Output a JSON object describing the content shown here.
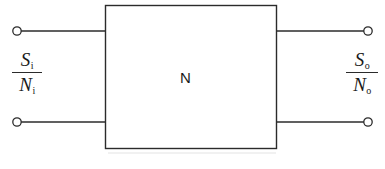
{
  "figure": {
    "type": "two-port-network-block-diagram",
    "background_color": "#ffffff",
    "line_color": "#2b2b2b",
    "text_color": "#1a1a1a",
    "block": {
      "label": "N",
      "x": 105,
      "y": 5,
      "width": 172,
      "height": 144,
      "fill": "#ffffff",
      "stroke": "#2b2b2b",
      "stroke_width": 1.4
    },
    "input_port": {
      "label_numerator": "S",
      "label_numerator_sub": "i",
      "label_denominator": "N",
      "label_denominator_sub": "i",
      "label_plain": "Si/Ni",
      "terminal_top": {
        "cx": 17,
        "cy": 31
      },
      "terminal_bottom": {
        "cx": 17,
        "cy": 122
      },
      "wire_top": {
        "x1": 22,
        "y1": 31,
        "x2": 105,
        "y2": 31
      },
      "wire_bottom": {
        "x1": 22,
        "y1": 122,
        "x2": 105,
        "y2": 122
      }
    },
    "output_port": {
      "label_numerator": "S",
      "label_numerator_sub": "o",
      "label_denominator": "N",
      "label_denominator_sub": "o",
      "label_plain": "So/No",
      "terminal_top": {
        "cx": 368,
        "cy": 31
      },
      "terminal_bottom": {
        "cx": 368,
        "cy": 122
      },
      "wire_top": {
        "x1": 277,
        "y1": 31,
        "x2": 363,
        "y2": 31
      },
      "wire_bottom": {
        "x1": 277,
        "y1": 122,
        "x2": 363,
        "y2": 122
      }
    },
    "terminal_radius": 4.2
  }
}
